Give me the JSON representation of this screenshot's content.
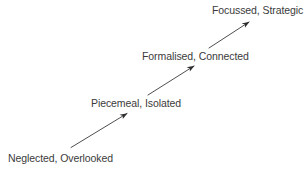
{
  "diagram": {
    "type": "progression-staircase",
    "title": "",
    "background_color": "#ffffff",
    "text_color": "#3b3b3b",
    "arrow_color": "#2e2e2e",
    "stages": [
      {
        "id": "stage-neglected",
        "label": "Neglected, Overlooked",
        "order": 1
      },
      {
        "id": "stage-piecemeal",
        "label": "Piecemeal, Isolated",
        "order": 2
      },
      {
        "id": "stage-formalised",
        "label": "Formalised, Connected",
        "order": 3
      },
      {
        "id": "stage-focussed",
        "label": "Focussed, Strategic",
        "order": 4
      }
    ],
    "arrows": [
      {
        "id": "arrow-1",
        "from": "stage-neglected",
        "to": "stage-piecemeal",
        "direction": "up-right",
        "x1": 71,
        "y1": 147.5,
        "x2": 127,
        "y2": 113.5
      },
      {
        "id": "arrow-2",
        "from": "stage-piecemeal",
        "to": "stage-formalised",
        "direction": "up-right",
        "x1": 148,
        "y1": 95,
        "x2": 194,
        "y2": 66
      },
      {
        "id": "arrow-3",
        "from": "stage-formalised",
        "to": "stage-focussed",
        "direction": "up-right",
        "x1": 209,
        "y1": 48,
        "x2": 249,
        "y2": 22
      }
    ]
  }
}
